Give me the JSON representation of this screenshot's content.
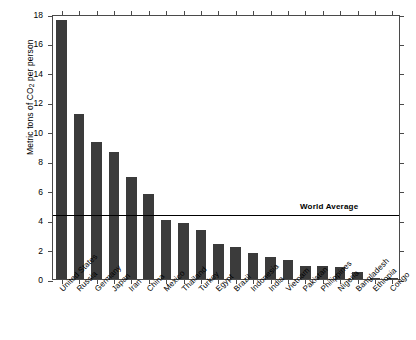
{
  "chart_data": {
    "type": "bar",
    "title": "",
    "xlabel": "",
    "ylabel": "Metric tons of CO2 per person",
    "ylabel_parts": {
      "pre": "Metric tons of CO",
      "sub": "2",
      "post": " per person"
    },
    "ylim": [
      0,
      18
    ],
    "ytick_labels": [
      "0",
      "2",
      "4",
      "6",
      "8",
      "10",
      "12",
      "14",
      "16",
      "18"
    ],
    "ytick_values": [
      0,
      2,
      4,
      6,
      8,
      10,
      12,
      14,
      16,
      18
    ],
    "grid": false,
    "legend": "none",
    "bar_color": "#3b3b3b",
    "axis_color": "#4a4a4a",
    "categories": [
      "United States",
      "Russia",
      "Germany",
      "Japan",
      "Iran",
      "China",
      "Mexico",
      "Thailand",
      "Turkey",
      "Egypt",
      "Brazil",
      "Indonesia",
      "India",
      "Vietnam",
      "Pakistan",
      "Philippines",
      "Nigeria",
      "Bangladesh",
      "Ethiopia",
      "Congo"
    ],
    "values": [
      17.6,
      11.2,
      9.3,
      8.6,
      6.9,
      5.8,
      4.0,
      3.8,
      3.3,
      2.4,
      2.2,
      1.8,
      1.5,
      1.3,
      0.9,
      0.9,
      0.8,
      0.5,
      0.1,
      0.04
    ],
    "annotations": [
      {
        "name": "world-average",
        "label": "World Average",
        "value": 4.45,
        "type": "hline",
        "color": "#000000"
      }
    ]
  }
}
